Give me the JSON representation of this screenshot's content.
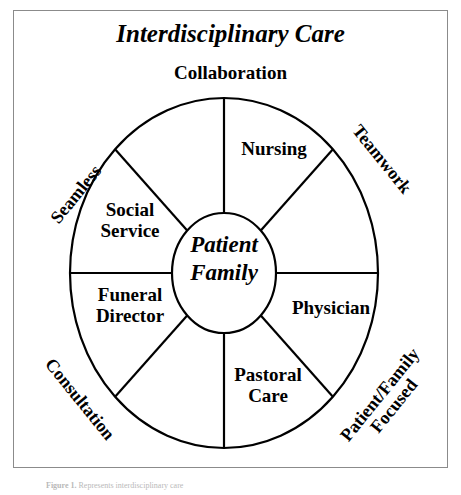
{
  "figure": {
    "title": "Interdisciplinary Care",
    "caption_lead": "Figure 1.",
    "caption_text": "Represents interdisciplinary care"
  },
  "center": {
    "line1": "Patient",
    "line2": "Family"
  },
  "outer_labels": {
    "top": "Collaboration",
    "upper_left": "Seamless",
    "upper_right": "Teamwork",
    "lower_left": "Consultation",
    "lower_right_line1": "Patient/Family",
    "lower_right_line2": "Focused"
  },
  "wedges": [
    {
      "id": "nursing",
      "line1": "Nursing",
      "line2": ""
    },
    {
      "id": "social",
      "line1": "Social",
      "line2": "Service"
    },
    {
      "id": "funeral",
      "line1": "Funeral",
      "line2": "Director"
    },
    {
      "id": "physician",
      "line1": "Physician",
      "line2": ""
    },
    {
      "id": "pastoral",
      "line1": "Pastoral",
      "line2": "Care"
    }
  ],
  "style": {
    "ink": "#000000",
    "paper": "#ffffff",
    "frame_border": "#8b8b8b",
    "caption_color": "#b9b9b9"
  },
  "geometry": {
    "outer_ellipse": {
      "cx": 224,
      "cy": 273,
      "rx": 154,
      "ry": 175
    },
    "inner_ellipse": {
      "cx": 224,
      "cy": 273,
      "rx": 52,
      "ry": 60
    },
    "spoke_angles_deg": [
      90,
      270,
      180,
      0,
      135,
      315,
      225,
      45
    ]
  }
}
